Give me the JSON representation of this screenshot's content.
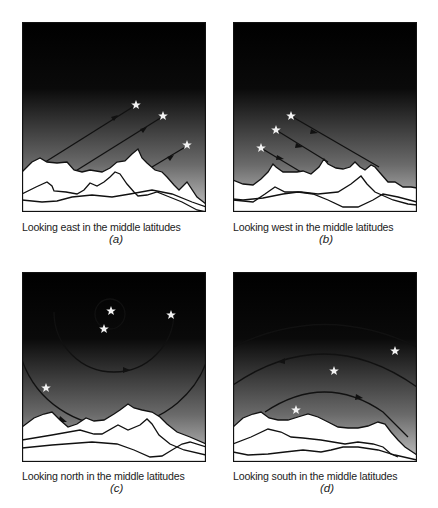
{
  "figure": {
    "panels": [
      {
        "id": "a",
        "caption": "Looking east in the middle latitudes",
        "label": "(a)",
        "direction": "east",
        "description": "Stars rise diagonally from lower-left to upper-right above the eastern horizon"
      },
      {
        "id": "b",
        "caption": "Looking west in the middle latitudes",
        "label": "(b)",
        "direction": "west",
        "description": "Stars set diagonally from upper-left down to lower-right toward the western horizon"
      },
      {
        "id": "c",
        "caption": "Looking north in the middle latitudes",
        "label": "(c)",
        "direction": "north",
        "description": "Stars circle counterclockwise around the celestial pole"
      },
      {
        "id": "d",
        "caption": "Looking south in the middle latitudes",
        "label": "(d)",
        "direction": "south",
        "description": "Stars move east to west along arcs above the southern horizon"
      }
    ],
    "colors": {
      "sky_top": "#000000",
      "sky_bottom": "#bdbdbd",
      "mountain_fill": "#ffffff",
      "line": "#111111",
      "star": "#f2f2f2"
    }
  }
}
